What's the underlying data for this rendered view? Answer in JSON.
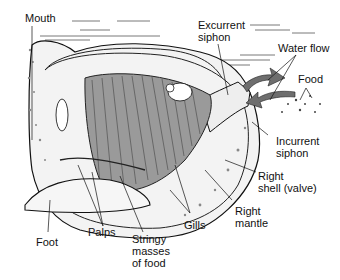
{
  "labels": {
    "mouth": "Mouth",
    "excurrent_siphon": "Excurrent\nsiphon",
    "water_flow": "Water flow",
    "food_right": "Food",
    "incurrent_siphon": "Incurrent\nsiphon",
    "right_shell": "Right\nshell (valve)",
    "right_mantle": "Right\nmantle",
    "gills": "Gills",
    "stringy_masses": "Stringy\nmasses\nof food",
    "palps": "Palps",
    "foot": "Foot"
  },
  "colors": {
    "ink": "#111111",
    "gill_fill": "#9a9a9a",
    "arrow_fill": "#6e6e6e",
    "shell_shade": "#d8d8d8"
  }
}
